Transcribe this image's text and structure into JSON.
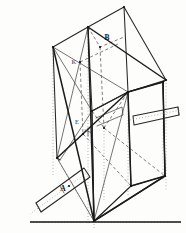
{
  "figure": {
    "background_color": "#fdfdfb",
    "ink_color": "#1b1b1b",
    "width": 186,
    "height": 233
  },
  "labels": [
    {
      "id": "label-a",
      "text": "A",
      "x": 63,
      "y": 191,
      "style": "bold"
    },
    {
      "id": "label-b",
      "text": "B",
      "x": 107,
      "y": 40,
      "style": "bold"
    },
    {
      "id": "label-k",
      "text": "K",
      "x": 74,
      "y": 64,
      "style": "small"
    },
    {
      "id": "label-e",
      "text": "E",
      "x": 77,
      "y": 124,
      "style": "small"
    }
  ],
  "ground_line": {
    "name": "ground-reference-line",
    "x1": 30,
    "y1": 222,
    "x2": 181,
    "y2": 222
  },
  "geometry": {
    "outer_box_solid": [
      "M 88 27 L 124 7 L 166 80 L 163 82",
      "M 88 27 L 53 47 L 57 158 L 60 160",
      "M 124 7 L 128 92 L 166 80",
      "M 88 27 L 92 111 L 128 92",
      "M 92 111 L 94 221 L 165 176 L 163 82"
    ],
    "frame_heavy": [
      "M 88 27 L 94 221",
      "M 88 27 L 166 80",
      "M 53 47 L 94 221",
      "M 57 158 L 128 92",
      "M 94 221 L 165 176",
      "M 128 92 L 131 186",
      "M 128 92 L 163 82",
      "M 163 82 L 165 176",
      "M 131 186 L 165 176"
    ],
    "diagonals_thin": [
      "M 53 47 L 128 92",
      "M 88 27 L 57 158",
      "M 57 158 L 94 221",
      "M 92 111 L 60 160",
      "M 53 47 L 92 111",
      "M 94 221 L 128 92",
      "M 94 221 L 131 186"
    ],
    "hidden_dashed": [
      "M 88 27 L 100 47 L 124 37",
      "M 100 47 L 104 128",
      "M 104 128 L 128 92",
      "M 92 111 L 104 128",
      "M 80 62 L 118 44",
      "M 80 62 L 83 134",
      "M 83 134 L 131 186",
      "M 104 128 L 165 176"
    ],
    "projector_dotted": [
      "M 53 47 L 53 175",
      "M 88 27 L 88 225",
      "M 94 221 L 94 228",
      "M 166 80 L 166 190",
      "M 163 82 L 163 180",
      "M 128 92 L 128 196",
      "M 57 158 L 94 221",
      "M 104 128 L 104 200",
      "M 30 222 L 181 222"
    ],
    "strut_lower_left": {
      "name": "lower-left-strut",
      "body": "M 84 168 L 36 203 L 41 212 L 90 177 Z",
      "cap": "M 36 203 L 41 212",
      "tick": "M 60 186 L 64 193",
      "axis": "M 88 172 L 30 214"
    },
    "strut_right": {
      "name": "right-strut",
      "body": "M 133 116 L 178 107 L 179 115 L 134 125 Z",
      "cap": "M 178 107 L 179 115",
      "axis": "M 130 120 L 181 110"
    },
    "inner_panel_solid": [
      "M 92 111 L 128 92 L 131 186 L 94 221 Z",
      "M 131 186 L 165 176 L 163 82 L 128 92"
    ],
    "small_detail": [
      "M 96 118 L 122 107 L 123 115 L 97 126",
      "M 85 130 L 92 133",
      "M 88 128 L 88 136"
    ]
  },
  "node_dots": [
    {
      "x": 88,
      "y": 27
    },
    {
      "x": 124,
      "y": 7
    },
    {
      "x": 53,
      "y": 47
    },
    {
      "x": 166,
      "y": 80
    },
    {
      "x": 163,
      "y": 82
    },
    {
      "x": 128,
      "y": 92
    },
    {
      "x": 92,
      "y": 111
    },
    {
      "x": 57,
      "y": 158
    },
    {
      "x": 131,
      "y": 186
    },
    {
      "x": 165,
      "y": 176
    },
    {
      "x": 94,
      "y": 221
    },
    {
      "x": 100,
      "y": 47
    },
    {
      "x": 104,
      "y": 128
    },
    {
      "x": 80,
      "y": 62
    },
    {
      "x": 83,
      "y": 134
    },
    {
      "x": 69,
      "y": 186
    }
  ]
}
